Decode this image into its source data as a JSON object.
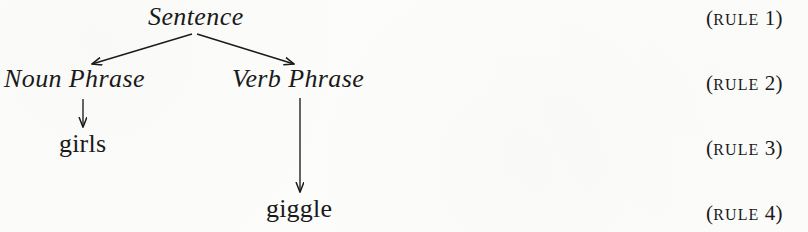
{
  "figure": {
    "type": "syntax-tree-derivation",
    "background_color": "#fcfcfb",
    "ink_color": "#1a1a1a"
  },
  "tree": {
    "nodes": [
      {
        "id": "sentence",
        "label": "Sentence",
        "kind": "nonterminal",
        "style": "italic"
      },
      {
        "id": "noun_phrase",
        "label": "Noun Phrase",
        "kind": "nonterminal",
        "style": "italic"
      },
      {
        "id": "verb_phrase",
        "label": "Verb Phrase",
        "kind": "nonterminal",
        "style": "italic"
      },
      {
        "id": "girls",
        "label": "girls",
        "kind": "terminal",
        "style": "roman"
      },
      {
        "id": "giggle",
        "label": "giggle",
        "kind": "terminal",
        "style": "roman"
      }
    ],
    "edges": [
      {
        "from": "sentence",
        "to": "noun_phrase",
        "arrowhead": true
      },
      {
        "from": "sentence",
        "to": "verb_phrase",
        "arrowhead": true
      },
      {
        "from": "noun_phrase",
        "to": "girls",
        "arrowhead": true
      },
      {
        "from": "verb_phrase",
        "to": "giggle",
        "arrowhead": true
      }
    ]
  },
  "rules": [
    {
      "open": "(",
      "word": "rule",
      "number": "1",
      "close": ")",
      "text": "(rule 1)"
    },
    {
      "open": "(",
      "word": "rule",
      "number": "2",
      "close": ")",
      "text": "(rule 2)"
    },
    {
      "open": "(",
      "word": "rule",
      "number": "3",
      "close": ")",
      "text": "(rule 3)"
    },
    {
      "open": "(",
      "word": "rule",
      "number": "4",
      "close": ")",
      "text": "(rule 4)"
    }
  ]
}
